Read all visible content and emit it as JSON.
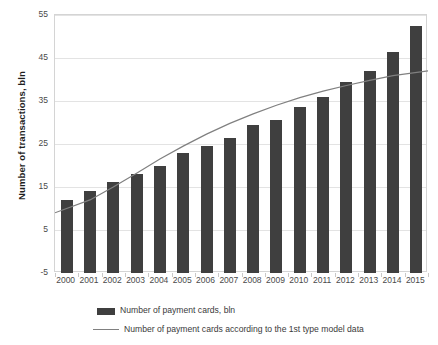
{
  "chart_data": {
    "type": "bar",
    "title": "",
    "xlabel": "",
    "ylabel": "Number of transactions, bln",
    "categories": [
      "2000",
      "2001",
      "2002",
      "2003",
      "2004",
      "2005",
      "2006",
      "2007",
      "2008",
      "2009",
      "2010",
      "2011",
      "2012",
      "2013",
      "2014",
      "2015"
    ],
    "yticks": [
      55,
      45,
      35,
      25,
      15,
      5,
      -5
    ],
    "ylim": [
      -5,
      55
    ],
    "grid": true,
    "legend_position": "bottom",
    "series": [
      {
        "name": "Number of payment cards, bln",
        "type": "bar",
        "color": "#3f3f3f",
        "values": [
          12.0,
          14.0,
          16.2,
          18.0,
          20.0,
          23.0,
          24.5,
          26.5,
          29.5,
          30.5,
          33.5,
          36.0,
          39.5,
          42.0,
          46.5,
          52.5
        ]
      },
      {
        "name": "Number of payment cards according to the 1st type model data",
        "type": "line",
        "color": "#808080",
        "values": [
          9.0,
          12.0,
          15.0,
          18.2,
          21.5,
          24.5,
          27.3,
          29.8,
          32.0,
          34.0,
          35.8,
          37.3,
          38.6,
          39.8,
          40.9,
          42.0
        ]
      }
    ]
  },
  "legend": {
    "items": [
      {
        "label": "Number of payment cards, bln",
        "marker": "swatch"
      },
      {
        "label": "Number of payment cards according to the 1st type model data",
        "marker": "line"
      }
    ]
  }
}
